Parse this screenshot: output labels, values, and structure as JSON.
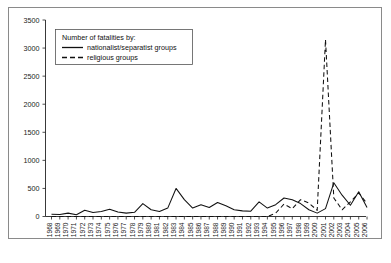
{
  "chart_data": {
    "type": "line",
    "title": "",
    "xlabel": "",
    "ylabel": "",
    "ylim": [
      0,
      3500
    ],
    "ytick_step": 500,
    "yticks": [
      0,
      500,
      1000,
      1500,
      2000,
      2500,
      3000,
      3500
    ],
    "grid": false,
    "legend_position": "top-left",
    "legend_title": "Number of fatalities by:",
    "categories": [
      1968,
      1969,
      1970,
      1971,
      1972,
      1973,
      1974,
      1975,
      1976,
      1977,
      1978,
      1979,
      1980,
      1981,
      1982,
      1983,
      1984,
      1985,
      1986,
      1987,
      1988,
      1989,
      1990,
      1991,
      1992,
      1993,
      1994,
      1995,
      1996,
      1997,
      1998,
      1999,
      2000,
      2001,
      2002,
      2003,
      2004,
      2005,
      2006
    ],
    "series": [
      {
        "name": "nationalist/separatist groups",
        "style": "solid",
        "color": "#111111",
        "values": [
          40,
          35,
          60,
          30,
          110,
          70,
          90,
          130,
          80,
          60,
          75,
          230,
          120,
          90,
          150,
          500,
          300,
          150,
          210,
          160,
          250,
          190,
          120,
          100,
          95,
          260,
          150,
          210,
          330,
          300,
          230,
          120,
          60,
          140,
          600,
          380,
          200,
          440,
          160
        ]
      },
      {
        "name": "religious groups",
        "style": "dashed",
        "color": "#111111",
        "values": [
          0,
          0,
          0,
          0,
          0,
          0,
          0,
          0,
          0,
          0,
          0,
          0,
          0,
          0,
          0,
          0,
          0,
          0,
          0,
          0,
          0,
          0,
          0,
          0,
          0,
          0,
          0,
          60,
          220,
          140,
          300,
          240,
          110,
          3150,
          330,
          120,
          260,
          420,
          230
        ]
      }
    ],
    "annotations": [
      {
        "label": "2001 peak",
        "x": 2001,
        "y": 3150,
        "series": "religious groups"
      }
    ]
  },
  "legend": {
    "title": "Number of fatalities by:",
    "items": [
      {
        "label": "nationalist/separatist groups",
        "style": "solid"
      },
      {
        "label": "religious groups",
        "style": "dashed"
      }
    ]
  }
}
